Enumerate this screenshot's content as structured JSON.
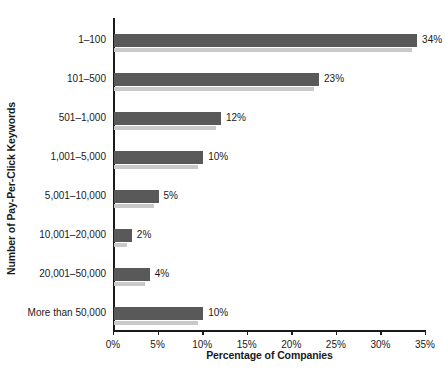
{
  "chart_data": {
    "type": "bar",
    "orientation": "horizontal",
    "title": "",
    "xlabel": "Percentage of Companies",
    "ylabel": "Number of Pay-Per-Click Keywords",
    "categories": [
      "1–100",
      "101–500",
      "501–1,000",
      "1,001–5,000",
      "5,001–10,000",
      "10,001–20,000",
      "20,001–50,000",
      "More than 50,000"
    ],
    "values": [
      34,
      23,
      12,
      10,
      5,
      2,
      4,
      10
    ],
    "value_labels": [
      "34%",
      "23%",
      "12%",
      "10%",
      "5%",
      "2%",
      "4%",
      "10%"
    ],
    "xlim": [
      0,
      35
    ],
    "xticks": [
      0,
      5,
      10,
      15,
      20,
      25,
      30,
      35
    ],
    "xtick_labels": [
      "0%",
      "5%",
      "10%",
      "15%",
      "20%",
      "25%",
      "30%",
      "35%"
    ],
    "grid": false,
    "legend": false,
    "bar_color": "#595959",
    "shadow_color": "#c9c9c9",
    "axis_color": "#1a1a1a",
    "background": "#ffffff"
  }
}
